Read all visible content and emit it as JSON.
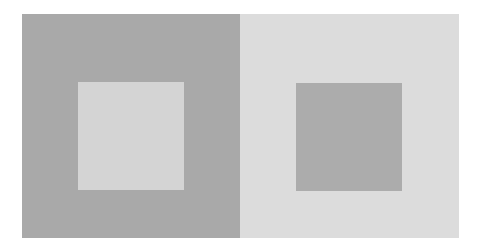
{
  "figure": {
    "left_panel": {
      "background_color": "#a9a9a9",
      "square_color": "#d4d4d4"
    },
    "right_panel": {
      "background_color": "#dcdcdc",
      "square_color": "#acacac"
    }
  }
}
